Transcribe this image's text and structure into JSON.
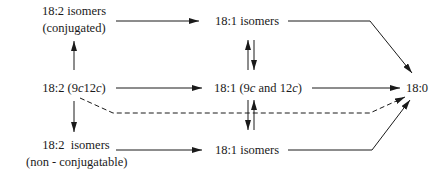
{
  "diagram": {
    "type": "reaction-pathway",
    "nodes": {
      "conj_isomers": {
        "line1": "18:2 isomers",
        "line2": "(conjugated)"
      },
      "linoleic": {
        "prefix": "18:2 (",
        "p1": "9",
        "c1": "c",
        "p2": "12",
        "c2": "c",
        "suffix": ")"
      },
      "nonconj_isomers": {
        "line1": "18:2  isomers",
        "line2": "(non - conjugatable)"
      },
      "top_18_1": {
        "label": "18:1 isomers"
      },
      "mid_18_1": {
        "prefix": "18:1 (",
        "p1": "9",
        "c1": "c",
        "mid": " and ",
        "p2": "12",
        "c2": "c",
        "suffix": ")"
      },
      "bot_18_1": {
        "label": "18:1 isomers"
      },
      "stearic": {
        "label": "18:0"
      }
    },
    "edges": [
      {
        "from": "18:2 (9c12c)",
        "to": "18:2 isomers (conjugated)",
        "style": "solid"
      },
      {
        "from": "18:2 (9c12c)",
        "to": "18:2 isomers (non-conjugatable)",
        "style": "solid"
      },
      {
        "from": "18:2 isomers (conjugated)",
        "to": "18:1 isomers (top)",
        "style": "solid"
      },
      {
        "from": "18:2 (9c12c)",
        "to": "18:1 (9c and 12c)",
        "style": "solid"
      },
      {
        "from": "18:2 isomers (non-conjugatable)",
        "to": "18:1 isomers (bottom)",
        "style": "solid"
      },
      {
        "from": "18:1 isomers (top)",
        "to": "18:1 (9c and 12c)",
        "style": "equilibrium"
      },
      {
        "from": "18:1 (9c and 12c)",
        "to": "18:1 isomers (bottom)",
        "style": "equilibrium"
      },
      {
        "from": "18:1 isomers (top)",
        "to": "18:0",
        "style": "solid"
      },
      {
        "from": "18:1 (9c and 12c)",
        "to": "18:0",
        "style": "solid"
      },
      {
        "from": "18:1 isomers (bottom)",
        "to": "18:0",
        "style": "solid"
      },
      {
        "from": "18:2 (9c12c)",
        "to": "18:0",
        "style": "dashed"
      }
    ],
    "colors": {
      "ink": "#1a1a1a",
      "background": "#ffffff"
    }
  }
}
